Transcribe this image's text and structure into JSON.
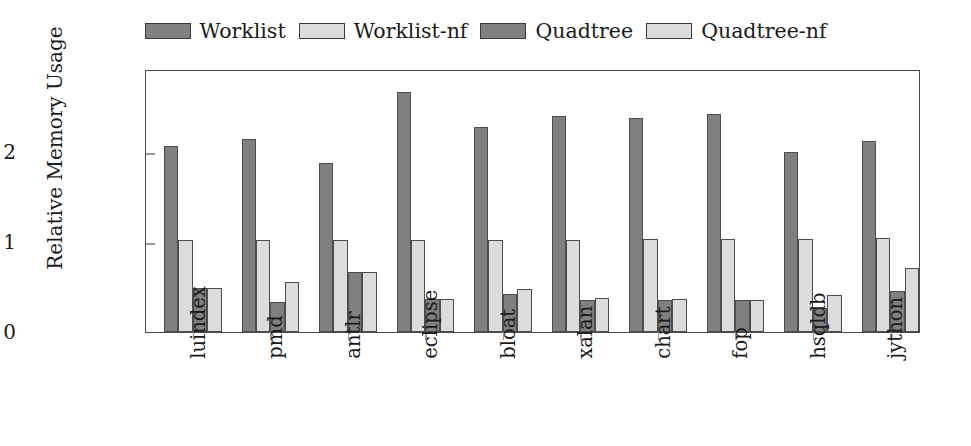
{
  "chart_data": {
    "type": "bar",
    "title": "",
    "xlabel": "",
    "ylabel": "Relative Memory Usage",
    "ylim": [
      0,
      2.92
    ],
    "yticks": [
      0,
      1,
      2
    ],
    "ytick_labels": [
      "0",
      "1",
      "2"
    ],
    "grid": false,
    "legend_position": "top-center",
    "categories": [
      "luindex",
      "pmd",
      "antlr",
      "eclipse",
      "bloat",
      "xalan",
      "chart",
      "fop",
      "hsqldb",
      "jython"
    ],
    "series": [
      {
        "name": "Worklist",
        "color": "#808080",
        "values": [
          2.07,
          2.14,
          1.88,
          2.67,
          2.28,
          2.4,
          2.38,
          2.42,
          2.0,
          2.12
        ]
      },
      {
        "name": "Worklist-nf",
        "color": "#dcdcdc",
        "values": [
          1.02,
          1.02,
          1.02,
          1.02,
          1.02,
          1.02,
          1.03,
          1.03,
          1.03,
          1.04
        ]
      },
      {
        "name": "Quadtree",
        "color": "#808080",
        "values": [
          0.49,
          0.33,
          0.67,
          0.37,
          0.42,
          0.36,
          0.36,
          0.35,
          0.27,
          0.46
        ]
      },
      {
        "name": "Quadtree-nf",
        "color": "#dcdcdc",
        "values": [
          0.49,
          0.56,
          0.67,
          0.37,
          0.48,
          0.38,
          0.37,
          0.36,
          0.41,
          0.71
        ]
      }
    ]
  },
  "legend": {
    "items": [
      {
        "label": "Worklist"
      },
      {
        "label": "Worklist-nf"
      },
      {
        "label": "Quadtree"
      },
      {
        "label": "Quadtree-nf"
      }
    ]
  },
  "axes": {
    "y_title": "Relative Memory Usage"
  }
}
